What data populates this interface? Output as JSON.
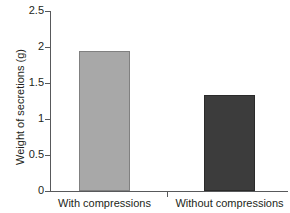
{
  "chart_data": {
    "type": "bar",
    "title": "",
    "xlabel": "",
    "ylabel": "Weight of secretions (g)",
    "categories": [
      "With compressions",
      "Without compressions"
    ],
    "values": [
      1.95,
      1.34
    ],
    "ylim": [
      0,
      2.5
    ],
    "yticks": [
      0,
      0.5,
      1,
      1.5,
      2,
      2.5
    ],
    "ytick_labels": [
      "0",
      "0.5",
      "1",
      "1.5",
      "2",
      "2.5"
    ],
    "grid": false,
    "legend": false,
    "bar_colors": [
      "#a8a8a8",
      "#3c3c3c"
    ],
    "axis_color": "#58595b",
    "text_color": "#231f20",
    "background": "#ffffff"
  },
  "axis": {
    "y_title": "Weight of secretions (g)"
  },
  "ticks": [
    {
      "label": "2.5",
      "value": 2.5
    },
    {
      "label": "2",
      "value": 2.0
    },
    {
      "label": "1.5",
      "value": 1.5
    },
    {
      "label": "1",
      "value": 1.0
    },
    {
      "label": "0.5",
      "value": 0.5
    },
    {
      "label": "0",
      "value": 0.0
    }
  ],
  "bars": [
    {
      "category": "With compressions",
      "value": 1.95,
      "color": "#a8a8a8"
    },
    {
      "category": "Without compressions",
      "value": 1.34,
      "color": "#3c3c3c"
    }
  ]
}
